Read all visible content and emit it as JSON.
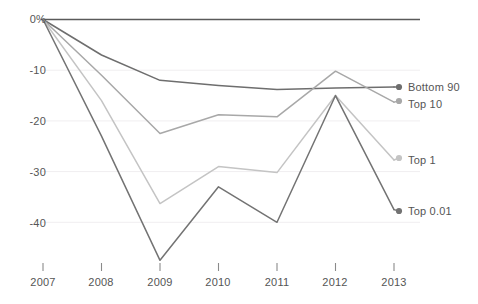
{
  "chart_data": {
    "type": "line",
    "title": "",
    "subtitle": "",
    "xlabel": "",
    "ylabel": "",
    "categories": [
      "2007",
      "2008",
      "2009",
      "2010",
      "2011",
      "2012",
      "2013"
    ],
    "x": [
      2007,
      2008,
      2009,
      2010,
      2011,
      2012,
      2013
    ],
    "ylim": [
      -50,
      0
    ],
    "xlim": [
      2007,
      2013
    ],
    "grid": true,
    "grid_axis": "y",
    "legend_position": "right-inline-endpoint-labels",
    "y_ticks": [
      0,
      -10,
      -20,
      -30,
      -40
    ],
    "y_tick_labels": [
      "0%",
      "-10",
      "-20",
      "-30",
      "-40"
    ],
    "x_ticks": [
      "2007",
      "2008",
      "2009",
      "2010",
      "2011",
      "2012",
      "2013"
    ],
    "units": "percent",
    "markers": "endpoint-dot-only",
    "series": [
      {
        "name": "Bottom 90",
        "color": "#6e6e6e",
        "values": [
          0,
          -7.0,
          -12.0,
          -13.0,
          -13.8,
          -13.5,
          -13.3
        ]
      },
      {
        "name": "Top 10",
        "color": "#a8a8a8",
        "values": [
          0,
          -11.0,
          -22.5,
          -18.8,
          -19.2,
          -10.2,
          -16.3
        ]
      },
      {
        "name": "Top 1",
        "color": "#c4c4c4",
        "values": [
          0,
          -16.0,
          -36.3,
          -29.0,
          -30.2,
          -15.0,
          -27.7
        ]
      },
      {
        "name": "Top 0.01",
        "color": "#737373",
        "values": [
          0,
          -23.0,
          -47.5,
          -33.0,
          -40.0,
          -15.0,
          -37.5
        ]
      }
    ]
  },
  "axes": {
    "y_labels": [
      {
        "text": "0%",
        "value": 0
      },
      {
        "text": "-10",
        "value": -10
      },
      {
        "text": "-20",
        "value": -20
      },
      {
        "text": "-30",
        "value": -30
      },
      {
        "text": "-40",
        "value": -40
      }
    ],
    "x_labels": [
      {
        "text": "2007"
      },
      {
        "text": "2008"
      },
      {
        "text": "2009"
      },
      {
        "text": "2010"
      },
      {
        "text": "2011"
      },
      {
        "text": "2012"
      },
      {
        "text": "2013"
      }
    ]
  },
  "series_labels": [
    {
      "text": "Bottom 90"
    },
    {
      "text": "Top 10"
    },
    {
      "text": "Top 1"
    },
    {
      "text": "Top 0.01"
    }
  ],
  "colors": {
    "background": "#ffffff",
    "gridline": "#f0eef0",
    "zero_line": "#5a5a5a",
    "tick": "#8a8a8a",
    "text": "#555555"
  }
}
